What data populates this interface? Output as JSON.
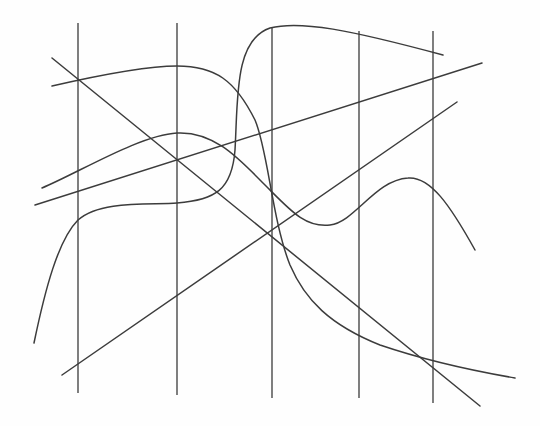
{
  "diagram": {
    "canvas": {
      "width": 540,
      "height": 426,
      "background": "#fefefe"
    },
    "stroke_color": "#3c3c3c",
    "vertical_lines": [
      {
        "id": "v1",
        "x": 78,
        "y1": 23,
        "y2": 393
      },
      {
        "id": "v2",
        "x": 177,
        "y1": 23,
        "y2": 395
      },
      {
        "id": "v3",
        "x": 272,
        "y1": 27,
        "y2": 398
      },
      {
        "id": "v4",
        "x": 359,
        "y1": 31,
        "y2": 398
      },
      {
        "id": "v5",
        "x": 433,
        "y1": 31,
        "y2": 403
      }
    ],
    "paths": [
      {
        "id": "diagonal-descending-line",
        "kind": "line",
        "d": "M52,58 L480,406"
      },
      {
        "id": "rising-line-upper",
        "kind": "line",
        "d": "M35,205 L482,63"
      },
      {
        "id": "rising-line-lower",
        "kind": "line",
        "d": "M62,375 L457,102"
      },
      {
        "id": "curve-plateau-then-drop",
        "kind": "curve",
        "d": "M52,86 C100,75 150,66 177,66 C215,66 235,80 255,120 C268,150 272,220 290,265 C305,300 330,325 380,345 C430,362 480,372 515,378"
      },
      {
        "id": "curve-wave",
        "kind": "curve",
        "d": "M42,188 C80,172 140,135 177,133 C215,131 240,160 265,185 C290,210 305,228 330,225 C355,222 375,180 408,178 C430,176 450,205 475,250"
      },
      {
        "id": "curve-step-rise",
        "kind": "curve",
        "d": "M34,343 C45,290 58,240 78,220 C100,200 150,205 177,203 C215,200 232,190 235,150 C238,100 234,40 270,28 C300,20 350,30 443,55"
      }
    ]
  }
}
